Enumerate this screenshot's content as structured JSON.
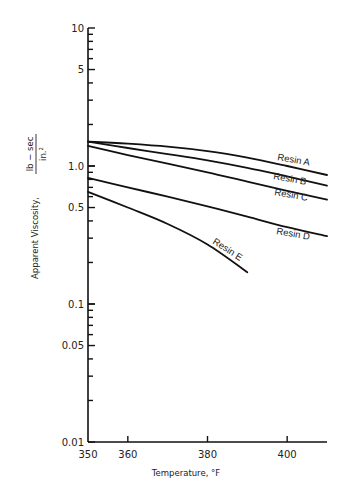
{
  "chart_data": {
    "type": "line",
    "title": "",
    "xlabel": "Temperature, °F",
    "ylabel": "Apparent Viscosity,",
    "ylabel_fraction": {
      "numerator": "lb − sec",
      "denominator": "in.²"
    },
    "xscale": "linear",
    "yscale": "log",
    "xlim": [
      350,
      410
    ],
    "ylim": [
      0.01,
      10
    ],
    "grid": false,
    "legend": "inline labels at curve ends",
    "x_ticks": [
      350,
      360,
      380,
      400
    ],
    "x_tick_labels": [
      "350",
      "360",
      "380",
      "400"
    ],
    "y_ticks": [
      0.01,
      0.05,
      0.1,
      0.5,
      1.0,
      5,
      10
    ],
    "y_tick_labels": [
      "0.01",
      "0.05",
      "0.1",
      "0.5",
      "1.0",
      "5",
      "10"
    ],
    "series": [
      {
        "name": "Resin A",
        "x": [
          350,
          360,
          370,
          380,
          390,
          400,
          410
        ],
        "values": [
          1.5,
          1.45,
          1.38,
          1.28,
          1.15,
          1.0,
          0.86
        ]
      },
      {
        "name": "Resin B",
        "x": [
          350,
          360,
          370,
          380,
          390,
          400,
          410
        ],
        "values": [
          1.5,
          1.35,
          1.22,
          1.1,
          0.97,
          0.84,
          0.72
        ]
      },
      {
        "name": "Resin C",
        "x": [
          350,
          360,
          370,
          380,
          390,
          400,
          410
        ],
        "values": [
          1.4,
          1.2,
          1.04,
          0.9,
          0.77,
          0.66,
          0.57
        ]
      },
      {
        "name": "Resin D",
        "x": [
          350,
          360,
          370,
          380,
          390,
          400,
          410
        ],
        "values": [
          0.82,
          0.7,
          0.6,
          0.51,
          0.43,
          0.36,
          0.31
        ]
      },
      {
        "name": "Resin E",
        "x": [
          350,
          360,
          370,
          380,
          390
        ],
        "values": [
          0.65,
          0.5,
          0.38,
          0.27,
          0.17
        ]
      }
    ]
  },
  "labels": {
    "x_axis_title": "Temperature, °F",
    "y_axis_title": "Apparent Viscosity,",
    "y_axis_numerator": "lb − sec",
    "y_axis_denominator": "in.²"
  }
}
